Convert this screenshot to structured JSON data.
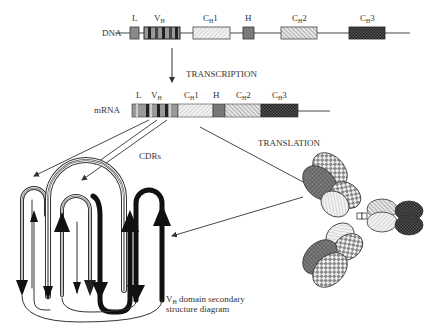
{
  "dna": {
    "label": "DNA",
    "segments": [
      {
        "name": "L",
        "main": "L",
        "sub": ""
      },
      {
        "name": "VH",
        "main": "V",
        "sub": "H"
      },
      {
        "name": "CH1",
        "main": "C",
        "sub": "H",
        "suffix": "1"
      },
      {
        "name": "H",
        "main": "H",
        "sub": ""
      },
      {
        "name": "CH2",
        "main": "C",
        "sub": "H",
        "suffix": "2"
      },
      {
        "name": "CH3",
        "main": "C",
        "sub": "H",
        "suffix": "3"
      }
    ]
  },
  "transcription_label": "TRANSCRIPTION",
  "mrna": {
    "label": "mRNA",
    "segments": [
      {
        "name": "L",
        "main": "L",
        "sub": ""
      },
      {
        "name": "VH",
        "main": "V",
        "sub": "H"
      },
      {
        "name": "CH1",
        "main": "C",
        "sub": "H",
        "suffix": "1"
      },
      {
        "name": "H",
        "main": "H",
        "sub": ""
      },
      {
        "name": "CH2",
        "main": "C",
        "sub": "H",
        "suffix": "2"
      },
      {
        "name": "CH3",
        "main": "C",
        "sub": "H",
        "suffix": "3"
      }
    ]
  },
  "translation_label": "TRANSLATION",
  "cdrs_label": "CDRs",
  "caption": {
    "line1_main": "V",
    "line1_sub": "H",
    "line1_rest": " domain secondary",
    "line2": "structure diagram"
  },
  "colors": {
    "line": "#444444",
    "dark_gray": "#7a7a7a",
    "mid_gray": "#9a9a9a",
    "light_hatch": "#d8d8d8",
    "black": "#111111"
  }
}
